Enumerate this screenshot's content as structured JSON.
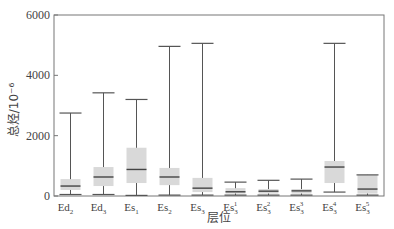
{
  "chart_data": {
    "type": "box",
    "title": "",
    "xlabel": "层位",
    "ylabel": "总烃/10⁻⁶",
    "ylim": [
      0,
      6000
    ],
    "yticks": [
      0,
      2000,
      4000,
      6000
    ],
    "grid": false,
    "legend": null,
    "categories": [
      {
        "base": "Ed",
        "sub": "2",
        "sup": ""
      },
      {
        "base": "Ed",
        "sub": "3",
        "sup": ""
      },
      {
        "base": "Es",
        "sub": "1",
        "sup": ""
      },
      {
        "base": "Es",
        "sub": "2",
        "sup": ""
      },
      {
        "base": "Es",
        "sub": "3",
        "sup": ""
      },
      {
        "base": "Es",
        "sub": "3",
        "sup": "1"
      },
      {
        "base": "Es",
        "sub": "3",
        "sup": "2"
      },
      {
        "base": "Es",
        "sub": "3",
        "sup": "3"
      },
      {
        "base": "Es",
        "sub": "3",
        "sup": "4"
      },
      {
        "base": "Es",
        "sub": "3",
        "sup": "5"
      }
    ],
    "boxes": [
      {
        "min": 50,
        "q1": 200,
        "median": 330,
        "q3": 560,
        "max": 2750
      },
      {
        "min": 50,
        "q1": 330,
        "median": 630,
        "q3": 960,
        "max": 3420
      },
      {
        "min": 20,
        "q1": 430,
        "median": 880,
        "q3": 1600,
        "max": 3200
      },
      {
        "min": 30,
        "q1": 360,
        "median": 630,
        "q3": 930,
        "max": 4960
      },
      {
        "min": 30,
        "q1": 130,
        "median": 260,
        "q3": 600,
        "max": 5060
      },
      {
        "min": 30,
        "q1": 80,
        "median": 140,
        "q3": 260,
        "max": 460
      },
      {
        "min": 30,
        "q1": 80,
        "median": 160,
        "q3": 230,
        "max": 520
      },
      {
        "min": 30,
        "q1": 80,
        "median": 170,
        "q3": 230,
        "max": 560
      },
      {
        "min": 130,
        "q1": 430,
        "median": 960,
        "q3": 1160,
        "max": 5060
      },
      {
        "min": 30,
        "q1": 80,
        "median": 230,
        "q3": 700,
        "max": 700
      }
    ],
    "colors": {
      "box_fill": "#d9d9d9",
      "line": "#555555",
      "median": "#444444",
      "axis": "#666666"
    }
  }
}
